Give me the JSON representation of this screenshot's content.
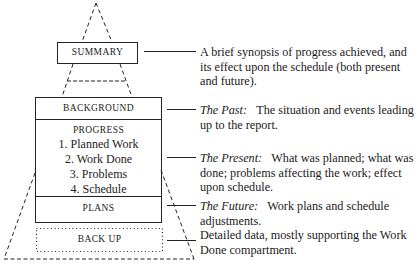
{
  "boxes": {
    "summary": "SUMMARY",
    "background": "BACKGROUND",
    "progress": {
      "heading": "PROGRESS",
      "items": [
        "1. Planned Work",
        "2. Work Done",
        "3. Problems",
        "4. Schedule"
      ]
    },
    "plans": "PLANS",
    "backup": "BACK UP"
  },
  "descriptions": {
    "summary": {
      "lead": "",
      "text": "A brief synopsis of progress achieved, and its effect upon the schedule (both present and future)."
    },
    "background": {
      "lead": "The Past:",
      "text": "The situation and events leading up to the report."
    },
    "progress": {
      "lead": "The Present:",
      "text": "What was planned; what was done; problems affecting the work; effect upon schedule."
    },
    "plans": {
      "lead": "The Future:",
      "text": "Work plans and schedule adjustments."
    },
    "backup": {
      "lead": "",
      "text": "Detailed data, mostly supporting the Work Done compartment."
    }
  }
}
